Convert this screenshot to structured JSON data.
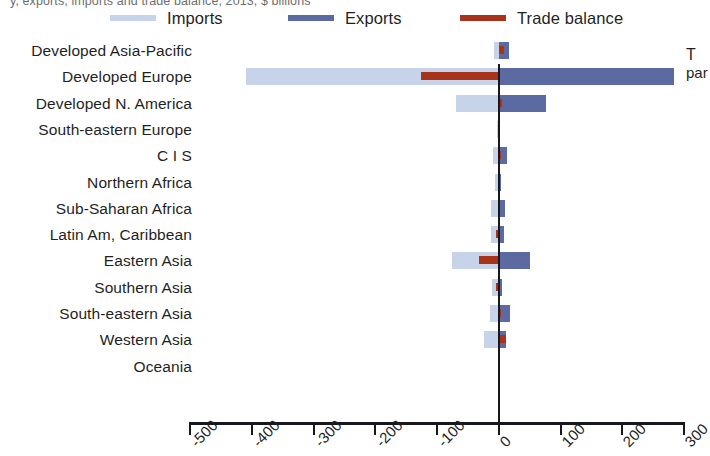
{
  "top_caption": "y, exports, imports and trade balance, 2013, $ billions",
  "edge_text": {
    "line1": "T",
    "line2": "par"
  },
  "legend": {
    "items": [
      {
        "label": "Imports",
        "color": "#c6d3e8",
        "name": "imports"
      },
      {
        "label": "Exports",
        "color": "#5b6ba2",
        "name": "exports"
      },
      {
        "label": "Trade balance",
        "color": "#a8321a",
        "name": "trade-balance"
      }
    ]
  },
  "colors": {
    "imports": "#c6d3e8",
    "exports": "#5b6ba2",
    "balance": "#a8321a",
    "axis": "#16181c"
  },
  "chart_data": {
    "type": "bar",
    "orientation": "horizontal",
    "title": "",
    "subtitle": "",
    "xlabel": "",
    "ylabel": "",
    "xlim": [
      -500,
      300
    ],
    "xticks": [
      -500,
      -400,
      -300,
      -200,
      -100,
      0,
      100,
      200,
      300
    ],
    "xticklabels": [
      "-500",
      "-400",
      "-300",
      "-200",
      "-100",
      "0",
      "100",
      "200",
      "300"
    ],
    "grid": false,
    "legend_position": "top",
    "categories": [
      "Developed Asia-Pacific",
      "Developed Europe",
      "Developed N. America",
      "South-eastern Europe",
      "C I S",
      "Northern Africa",
      "Sub-Saharan Africa",
      "Latin Am, Caribbean",
      "Eastern Asia",
      "Southern Asia",
      "South-eastern Asia",
      "Western Asia",
      "Oceania"
    ],
    "series": [
      {
        "name": "Imports",
        "color": "#c6d3e8",
        "values": [
          -8,
          -410,
          -70,
          -3,
          -10,
          -6,
          -12,
          -12,
          -76,
          -11,
          -14,
          -24,
          -1
        ]
      },
      {
        "name": "Exports",
        "color": "#5b6ba2",
        "values": [
          16,
          284,
          76,
          2,
          14,
          4,
          10,
          8,
          50,
          6,
          18,
          12,
          1
        ]
      },
      {
        "name": "Trade balance",
        "color": "#a8321a",
        "values": [
          8,
          -126,
          6,
          -1,
          4,
          -2,
          -2,
          -4,
          -32,
          -5,
          4,
          12,
          0
        ]
      }
    ]
  }
}
